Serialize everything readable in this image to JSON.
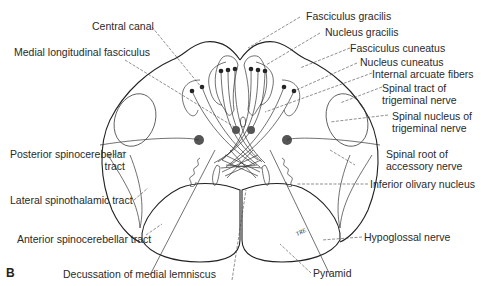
{
  "figure": {
    "panel_letter": "B",
    "initials": "TRE"
  },
  "labels": {
    "central_canal": "Central canal",
    "medial_longitudinal_fasciculus": "Medial longitudinal fasciculus",
    "fasciculus_gracilis": "Fasciculus gracilis",
    "nucleus_gracilis": "Nucleus gracilis",
    "fasciculus_cuneatus": "Fasciculus cuneatus",
    "nucleus_cuneatus": "Nucleus cuneatus",
    "internal_arcuate_fibers": "Internal arcuate fibers",
    "spinal_tract_trigeminal_1": "Spinal tract of",
    "spinal_tract_trigeminal_2": "trigeminal nerve",
    "spinal_nucleus_trigeminal_1": "Spinal nucleus of",
    "spinal_nucleus_trigeminal_2": "trigeminal nerve",
    "posterior_spinocerebellar_1": "Posterior spinocerebellar",
    "posterior_spinocerebellar_2": "tract",
    "spinal_root_accessory_1": "Spinal root of",
    "spinal_root_accessory_2": "accessory nerve",
    "lateral_spinothalamic": "Lateral spinothalamic tract",
    "inferior_olivary_nucleus": "Inferior olivary nucleus",
    "anterior_spinocerebellar": "Anterior spinocerebellar tract",
    "hypoglossal_nerve": "Hypoglossal nerve",
    "decussation_medial_lemniscus": "Decussation of medial lemniscus",
    "pyramid": "Pyramid"
  }
}
